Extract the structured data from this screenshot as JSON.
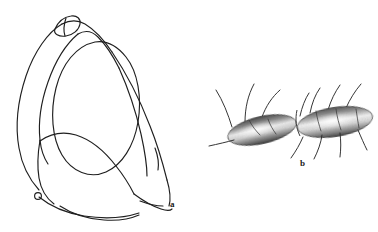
{
  "plate": {
    "background_color": "#ffffff",
    "ink_color": "#1f1f1f",
    "width": 378,
    "height": 232,
    "type": "scientific-line-illustration"
  },
  "figures": [
    {
      "id": "figure-a",
      "label": "a",
      "label_position": {
        "x": 170,
        "y": 200
      },
      "style": "outline-line-drawing",
      "description": "Rounded sub-triangular ring-like sclerite drawn in plain outline with an inner oval aperture, a small elongate two-lobed papilla at the dorsal apex and a small rounded papilla on the lower left margin.",
      "stroke_color": "#1f1f1f",
      "stroke_width": 1.1,
      "fill": "none",
      "bounds": {
        "x": 14,
        "y": 14,
        "width": 160,
        "height": 206
      }
    },
    {
      "id": "figure-b",
      "label": "b",
      "label_position": {
        "x": 300,
        "y": 159
      },
      "style": "stippled-shaded-drawing",
      "description": "Two elongate cylindrical segments joined end to end, obliquely oriented, rendered with graded stipple shading (dark margins, pale highlight along the midline) and bearing long slender setae projecting dorsally and ventrally.",
      "segment_count": 2,
      "seta_count": 12,
      "shading": {
        "highlight_color": "#f2f2f2",
        "midtone_color": "#9a9a9a",
        "shadow_color": "#4a4a4a"
      },
      "bounds": {
        "x": 206,
        "y": 80,
        "width": 170,
        "height": 90
      }
    }
  ],
  "labels": {
    "a": "a",
    "b": "b"
  }
}
